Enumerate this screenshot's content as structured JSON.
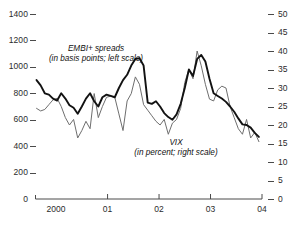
{
  "chart_data": {
    "type": "line",
    "title": "",
    "subtitle": "",
    "xlabel": "",
    "ylabel": "",
    "grid": false,
    "legend_position": "inline-annotations",
    "x_axis": {
      "tick_labels": [
        "2000",
        "01",
        "02",
        "03",
        "04"
      ],
      "tick_values": [
        2000,
        2001,
        2002,
        2003,
        2004
      ],
      "range": [
        1999.6,
        2004.0
      ]
    },
    "y_axis_left": {
      "label": "EMBI+ spreads (in basis points)",
      "tick_labels": [
        "0",
        "200",
        "400",
        "600",
        "800",
        "1000",
        "1200",
        "1400"
      ],
      "tick_values": [
        0,
        200,
        400,
        600,
        800,
        1000,
        1200,
        1400
      ],
      "ylim": [
        0,
        1400
      ],
      "side": "left"
    },
    "y_axis_right": {
      "label": "VIX (in percent)",
      "tick_labels": [
        "0",
        "5",
        "10",
        "15",
        "20",
        "25",
        "30",
        "35",
        "40",
        "45",
        "50"
      ],
      "tick_values": [
        0,
        5,
        10,
        15,
        20,
        25,
        30,
        35,
        40,
        45,
        50
      ],
      "ylim": [
        0,
        50
      ],
      "side": "right"
    },
    "series": [
      {
        "name": "EMBI+ spreads",
        "axis": "left",
        "units": "basis points",
        "color": "#121212",
        "line_width": 1.9,
        "x": [
          1999.62,
          1999.7,
          1999.78,
          1999.86,
          1999.94,
          2000.02,
          2000.1,
          2000.18,
          2000.26,
          2000.34,
          2000.42,
          2000.5,
          2000.58,
          2000.66,
          2000.74,
          2000.82,
          2000.9,
          2000.98,
          2001.06,
          2001.14,
          2001.22,
          2001.3,
          2001.38,
          2001.46,
          2001.54,
          2001.62,
          2001.7,
          2001.78,
          2001.86,
          2001.94,
          2002.02,
          2002.1,
          2002.18,
          2002.26,
          2002.34,
          2002.42,
          2002.5,
          2002.58,
          2002.66,
          2002.74,
          2002.82,
          2002.9,
          2002.98,
          2003.06,
          2003.14,
          2003.22,
          2003.3,
          2003.38,
          2003.46,
          2003.54,
          2003.62,
          2003.7,
          2003.78,
          2003.86,
          2003.94
        ],
        "values": [
          900,
          860,
          800,
          790,
          760,
          745,
          800,
          760,
          710,
          690,
          645,
          700,
          760,
          800,
          740,
          700,
          770,
          790,
          780,
          770,
          840,
          900,
          940,
          1010,
          1060,
          1065,
          1010,
          730,
          720,
          740,
          700,
          650,
          620,
          600,
          640,
          720,
          840,
          980,
          930,
          1060,
          1090,
          1040,
          910,
          800,
          780,
          760,
          735,
          700,
          660,
          610,
          565,
          560,
          540,
          500,
          470
        ]
      },
      {
        "name": "VIX",
        "axis": "right",
        "units": "percent",
        "color": "#6e6e6e",
        "line_width": 1.0,
        "x": [
          1999.62,
          1999.7,
          1999.78,
          1999.86,
          1999.94,
          2000.02,
          2000.1,
          2000.18,
          2000.26,
          2000.34,
          2000.42,
          2000.5,
          2000.58,
          2000.66,
          2000.74,
          2000.82,
          2000.9,
          2000.98,
          2001.06,
          2001.14,
          2001.22,
          2001.3,
          2001.38,
          2001.46,
          2001.54,
          2001.62,
          2001.7,
          2001.78,
          2001.86,
          2001.94,
          2002.02,
          2002.1,
          2002.18,
          2002.26,
          2002.34,
          2002.42,
          2002.5,
          2002.58,
          2002.66,
          2002.74,
          2002.82,
          2002.9,
          2002.98,
          2003.06,
          2003.14,
          2003.22,
          2003.3,
          2003.38,
          2003.46,
          2003.54,
          2003.62,
          2003.7,
          2003.78,
          2003.86,
          2003.94
        ],
        "values": [
          24.5,
          23.8,
          24.2,
          25.5,
          26.8,
          27.2,
          25.0,
          22.0,
          20.0,
          21.5,
          16.5,
          18.5,
          21.0,
          19.0,
          28.5,
          22.0,
          25.0,
          27.5,
          27.8,
          27.5,
          23.0,
          18.5,
          26.5,
          28.5,
          33.0,
          31.0,
          25.5,
          24.0,
          22.5,
          21.0,
          20.0,
          21.5,
          17.5,
          20.5,
          21.5,
          24.5,
          31.5,
          35.0,
          32.5,
          40.0,
          36.0,
          31.0,
          27.0,
          26.5,
          29.5,
          30.5,
          30.0,
          25.0,
          22.0,
          19.0,
          17.5,
          21.5,
          16.5,
          18.0,
          15.5
        ]
      }
    ],
    "annotations": [
      {
        "name": "embi-annotation",
        "line1": "EMBI+ spreads",
        "line2": "(in basis points; left scale)"
      },
      {
        "name": "vix-annotation",
        "line1": "VIX",
        "line2": "(in percent; right scale)"
      }
    ]
  },
  "colors": {
    "embi_line": "#121212",
    "vix_line": "#6e6e6e",
    "axis": "#4a4a4a",
    "text": "#2b2b2b",
    "background": "#ffffff"
  }
}
